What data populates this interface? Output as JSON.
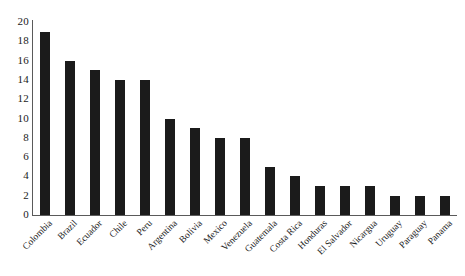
{
  "chart_data": {
    "type": "bar",
    "title": "",
    "subtitle": "",
    "xlabel": "",
    "ylabel": "",
    "legend": [],
    "legend_position": "none",
    "grid": false,
    "ylim": [
      0,
      20
    ],
    "ytick_step": 2,
    "yticks": [
      "20",
      "18",
      "16",
      "14",
      "12",
      "10",
      "8",
      "6",
      "4",
      "2",
      "0"
    ],
    "categories": [
      "Colombia",
      "Brazil",
      "Ecuador",
      "Chile",
      "Peru",
      "Argentina",
      "Bolivia",
      "Mexico",
      "Venezuela",
      "Guatemala",
      "Costa Rica",
      "Honduras",
      "El Salvador",
      "Nicargua",
      "Uruguay",
      "Paraguay",
      "Panama"
    ],
    "values": [
      19,
      16,
      15,
      14,
      14,
      10,
      9,
      8,
      8,
      5,
      4,
      3,
      3,
      3,
      2,
      2,
      2
    ],
    "bar_color": "#1b1b1b",
    "axis_color": "#5a5a5a",
    "background_color": "#ffffff"
  }
}
